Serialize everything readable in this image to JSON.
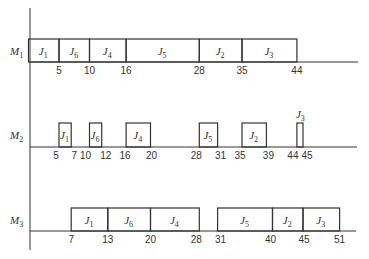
{
  "chart_data": {
    "type": "gantt",
    "title": "",
    "machines": [
      {
        "name": "M1",
        "label": "M",
        "sub": "1",
        "jobs": [
          {
            "job": "J",
            "sub": "1",
            "start": 0,
            "end": 5
          },
          {
            "job": "J",
            "sub": "6",
            "start": 5,
            "end": 10
          },
          {
            "job": "J",
            "sub": "4",
            "start": 10,
            "end": 16
          },
          {
            "job": "J",
            "sub": "5",
            "start": 16,
            "end": 28
          },
          {
            "job": "J",
            "sub": "2",
            "start": 28,
            "end": 35
          },
          {
            "job": "J",
            "sub": "3",
            "start": 35,
            "end": 44
          }
        ],
        "ticks": [
          "5",
          "10",
          "16",
          "28",
          "35",
          "44"
        ]
      },
      {
        "name": "M2",
        "label": "M",
        "sub": "2",
        "jobs": [
          {
            "job": "J",
            "sub": "1",
            "start": 5,
            "end": 7
          },
          {
            "job": "J",
            "sub": "6",
            "start": 10,
            "end": 12
          },
          {
            "job": "J",
            "sub": "4",
            "start": 16,
            "end": 20
          },
          {
            "job": "J",
            "sub": "5",
            "start": 28,
            "end": 31
          },
          {
            "job": "J",
            "sub": "2",
            "start": 35,
            "end": 39
          },
          {
            "job": "J",
            "sub": "3",
            "start": 44,
            "end": 45
          }
        ],
        "ticks": [
          "5",
          "7",
          "10",
          "12",
          "16",
          "20",
          "28",
          "31",
          "35",
          "39",
          "44",
          "45"
        ]
      },
      {
        "name": "M3",
        "label": "M",
        "sub": "3",
        "jobs": [
          {
            "job": "J",
            "sub": "1",
            "start": 7,
            "end": 13
          },
          {
            "job": "J",
            "sub": "6",
            "start": 13,
            "end": 20
          },
          {
            "job": "J",
            "sub": "4",
            "start": 20,
            "end": 28
          },
          {
            "job": "J",
            "sub": "5",
            "start": 31,
            "end": 40
          },
          {
            "job": "J",
            "sub": "2",
            "start": 40,
            "end": 45
          },
          {
            "job": "J",
            "sub": "3",
            "start": 45,
            "end": 51
          }
        ],
        "ticks": [
          "7",
          "13",
          "20",
          "28",
          "31",
          "40",
          "45",
          "51"
        ]
      }
    ],
    "xlabel": "",
    "ylabel": "",
    "xlim": [
      0,
      51
    ],
    "grid": false
  }
}
